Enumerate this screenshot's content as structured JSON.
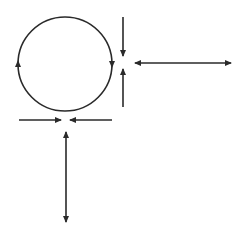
{
  "diagram": {
    "background": "#ffffff",
    "stroke_color": "#2a2a2a",
    "circle": {
      "cx": 65,
      "cy": 64,
      "r": 47,
      "direction": "clockwise",
      "arrowheads": [
        {
          "position": "left",
          "x": 18,
          "y": 64,
          "pointing": "up"
        },
        {
          "position": "right",
          "x": 112,
          "y": 64,
          "pointing": "down"
        }
      ]
    },
    "arrows": [
      {
        "name": "right-top-down-arrow",
        "x1": 123,
        "y1": 17,
        "x2": 123,
        "y2": 56,
        "heads": "end"
      },
      {
        "name": "right-bottom-up-arrow",
        "x1": 123,
        "y1": 107,
        "x2": 123,
        "y2": 69,
        "heads": "end"
      },
      {
        "name": "horizontal-double-arrow",
        "x1": 135,
        "y1": 63,
        "x2": 231,
        "y2": 63,
        "heads": "both"
      },
      {
        "name": "bottom-left-right-arrow",
        "x1": 19,
        "y1": 120,
        "x2": 61,
        "y2": 120,
        "heads": "end"
      },
      {
        "name": "bottom-right-left-arrow",
        "x1": 112,
        "y1": 120,
        "x2": 70,
        "y2": 120,
        "heads": "end"
      },
      {
        "name": "vertical-double-arrow",
        "x1": 66,
        "y1": 132,
        "x2": 66,
        "y2": 222,
        "heads": "both"
      }
    ]
  }
}
